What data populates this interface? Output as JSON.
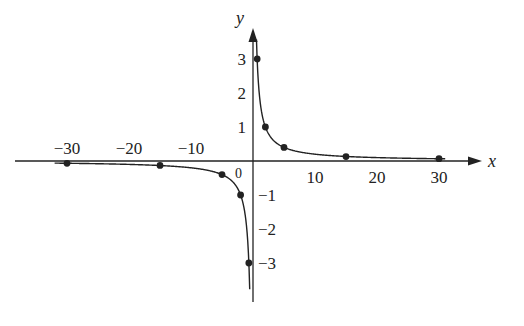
{
  "chart_data": {
    "type": "line",
    "title": "",
    "xlabel": "x",
    "ylabel": "y",
    "origin_label": "0",
    "xlim": [
      -35,
      35
    ],
    "ylim": [
      -4,
      4
    ],
    "x_ticks": [
      -30,
      -20,
      -10,
      10,
      20,
      30
    ],
    "x_tick_labels": [
      "−30",
      "−20",
      "−10",
      "10",
      "20",
      "30"
    ],
    "y_ticks": [
      3,
      2,
      1,
      -1,
      -2,
      -3
    ],
    "y_tick_labels": [
      "3",
      "2",
      "1",
      "−1",
      "−2",
      "−3"
    ],
    "grid": false,
    "legend": null,
    "series": [
      {
        "name": "right branch",
        "points": [
          [
            0.67,
            3
          ],
          [
            2,
            1
          ],
          [
            5,
            0.4
          ],
          [
            15,
            0.13
          ],
          [
            30,
            0.067
          ]
        ]
      },
      {
        "name": "left branch",
        "points": [
          [
            -30,
            -0.067
          ],
          [
            -15,
            -0.13
          ],
          [
            -5,
            -0.4
          ],
          [
            -2,
            -1
          ],
          [
            -0.67,
            -3
          ]
        ]
      }
    ],
    "color": "#222222"
  }
}
